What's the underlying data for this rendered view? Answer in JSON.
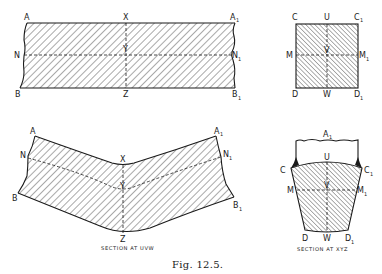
{
  "figure": {
    "caption": "Fig. 12.5.",
    "panels": {
      "straight_beam": {
        "labels": {
          "A": "A",
          "A1": "A",
          "A1_sub": "1",
          "X": "X",
          "N": "N",
          "N1": "N",
          "N1_sub": "1",
          "Y": "Y",
          "B": "B",
          "B1": "B",
          "B1_sub": "1",
          "Z": "Z"
        }
      },
      "square_section": {
        "labels": {
          "C": "C",
          "U": "U",
          "C1": "C",
          "C1_sub": "1",
          "M": "M",
          "V": "V",
          "M1": "M",
          "M1_sub": "1",
          "D": "D",
          "W": "W",
          "D1": "D",
          "D1_sub": "1"
        }
      },
      "bent_beam": {
        "labels": {
          "A": "A",
          "A1": "A",
          "A1_sub": "1",
          "N": "N",
          "N1": "N",
          "N1_sub": "1",
          "X": "X",
          "Y": "Y",
          "B": "B",
          "B1": "B",
          "B1_sub": "1",
          "Z": "Z"
        },
        "caption": "SECTION AT UVW"
      },
      "deformed_section": {
        "labels": {
          "A1": "A",
          "A1_sub": "1",
          "C": "C",
          "U": "U",
          "C1": "C",
          "C1_sub": "1",
          "M": "M",
          "V": "V",
          "M1": "M",
          "M1_sub": "1",
          "D": "D",
          "W": "W",
          "D1": "D",
          "D1_sub": "1"
        },
        "caption": "SECTION AT XYZ"
      }
    }
  }
}
